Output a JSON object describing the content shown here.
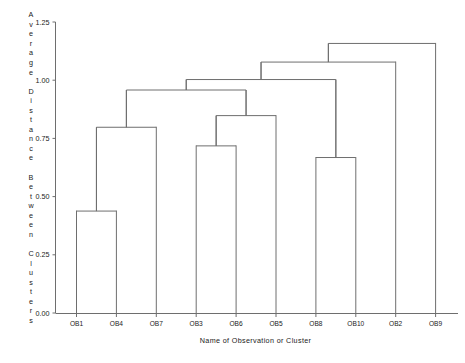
{
  "chart_data": {
    "type": "dendrogram",
    "title": "",
    "xlabel": "Name of Observation or Cluster",
    "ylabel": "Average Distance Between Clusters",
    "ylabel_letters": [
      "A",
      "v",
      "e",
      "r",
      "a",
      "g",
      "e",
      "",
      "D",
      "i",
      "s",
      "t",
      "a",
      "n",
      "c",
      "e",
      "",
      "B",
      "e",
      "t",
      "w",
      "e",
      "e",
      "n",
      "",
      "C",
      "l",
      "u",
      "s",
      "t",
      "e",
      "r",
      "s"
    ],
    "ylim": [
      0.0,
      1.25
    ],
    "yticks": [
      0.0,
      0.25,
      0.5,
      0.75,
      1.0,
      1.25
    ],
    "ytick_labels": [
      "0.00",
      "0.25",
      "0.50",
      "0.75",
      "1.00",
      "1.25"
    ],
    "grid": false,
    "legend": "none",
    "leaf_order": [
      "OB1",
      "OB4",
      "OB7",
      "OB3",
      "OB6",
      "OB5",
      "OB8",
      "OB10",
      "OB2",
      "OB9"
    ],
    "xtick_labels": [
      "OB1",
      "OB4",
      "OB7",
      "OB3",
      "OB6",
      "OB5",
      "OB8",
      "OB10",
      "OB2",
      "OB9"
    ],
    "merges": [
      {
        "id": "m1",
        "left": "OB1",
        "right": "OB4",
        "height": 0.44
      },
      {
        "id": "m2",
        "left": "OB3",
        "right": "OB6",
        "height": 0.72
      },
      {
        "id": "m3",
        "left": "OB8",
        "right": "OB10",
        "height": 0.67
      },
      {
        "id": "m4",
        "left": "m1",
        "right": "OB7",
        "height": 0.8
      },
      {
        "id": "m5",
        "left": "m2",
        "right": "OB5",
        "height": 0.85
      },
      {
        "id": "m6",
        "left": "m4",
        "right": "m5",
        "height": 0.96
      },
      {
        "id": "m7",
        "left": "m6",
        "right": "m3",
        "height": 1.005
      },
      {
        "id": "m8",
        "left": "m7",
        "right": "OB2",
        "height": 1.08
      },
      {
        "id": "m9",
        "left": "m8",
        "right": "OB9",
        "height": 1.16
      }
    ],
    "line_color": "#6e6e6e",
    "text_color": "#1a1a1a",
    "background": "#ffffff"
  }
}
